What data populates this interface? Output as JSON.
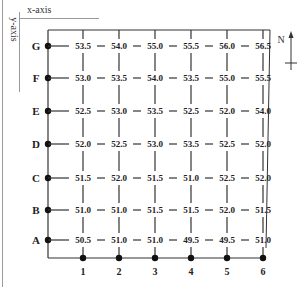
{
  "axes": {
    "x_label": "x-axis",
    "y_label": "y-axis"
  },
  "compass": {
    "label": "N"
  },
  "rows": [
    "G",
    "F",
    "E",
    "D",
    "C",
    "B",
    "A"
  ],
  "columns": [
    "1",
    "2",
    "3",
    "4",
    "5",
    "6"
  ],
  "grid_values": {
    "G": [
      "53.5",
      "54.0",
      "55.0",
      "55.5",
      "56.0",
      "56.5"
    ],
    "F": [
      "53.0",
      "53.5",
      "54.0",
      "53.5",
      "55.0",
      "55.5"
    ],
    "E": [
      "52.5",
      "53.0",
      "53.5",
      "52.5",
      "52.0",
      "54.0"
    ],
    "D": [
      "52.0",
      "52.5",
      "53.0",
      "53.5",
      "52.5",
      "52.0"
    ],
    "C": [
      "51.5",
      "52.0",
      "51.5",
      "51.0",
      "52.5",
      "52.0"
    ],
    "B": [
      "51.0",
      "51.0",
      "51.5",
      "51.5",
      "52.0",
      "51.5"
    ],
    "A": [
      "50.5",
      "51.0",
      "51.0",
      "49.5",
      "49.5",
      "51.0"
    ]
  }
}
